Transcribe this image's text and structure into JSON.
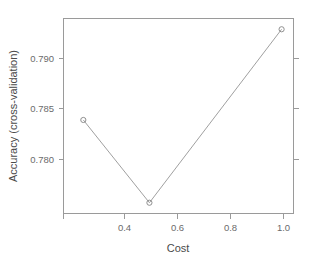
{
  "chart_data": {
    "type": "line",
    "title": "",
    "subtitle": "",
    "xlabel": "Cost",
    "ylabel": "Accuracy (cross-validation)",
    "x": [
      0.25,
      0.5,
      1.0
    ],
    "values": [
      0.7835,
      0.7762,
      0.7915
    ],
    "series": [
      {
        "name": "Accuracy (cross-validation)",
        "x": [
          0.25,
          0.5,
          1.0
        ],
        "values": [
          0.7835,
          0.7762,
          0.7915
        ]
      }
    ],
    "xlim": [
      0.175,
      1.045
    ],
    "ylim": [
      0.77525,
      0.79245
    ],
    "xticks": [
      0.4,
      0.6,
      0.8,
      1.0
    ],
    "xtick_labels": [
      "0.4",
      "0.6",
      "0.8",
      "1.0"
    ],
    "yticks": [
      0.78,
      0.785,
      0.79
    ],
    "ytick_labels": [
      "0.780",
      "0.785",
      "0.790"
    ],
    "grid": false,
    "legend": false,
    "legend_position": "none",
    "marker": "open-circle",
    "line_color": "#a0a0a0",
    "marker_color": "#8f8f8f",
    "axis_color": "#9a9a9a",
    "text_color": "#6b6b6b",
    "background": "#ffffff",
    "annotations": []
  },
  "axes": {
    "x_title": "Cost",
    "y_title": "Accuracy (cross-validation)",
    "x_tick_labels": [
      "0.4",
      "0.6",
      "0.8",
      "1.0"
    ],
    "y_tick_labels": [
      "0.780",
      "0.785",
      "0.790"
    ]
  }
}
